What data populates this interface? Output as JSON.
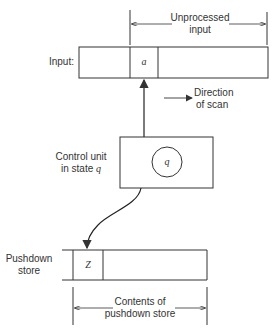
{
  "diagram": {
    "type": "pushdown-automaton-schematic",
    "input_tape": {
      "label": "Input:",
      "current_symbol": "a",
      "unprocessed_label_line1": "Unprocessed",
      "unprocessed_label_line2": "input"
    },
    "scan_direction": {
      "line1": "Direction",
      "line2": "of scan"
    },
    "control_unit": {
      "label_line1": "Control unit",
      "label_line2_prefix": "in state ",
      "state_symbol": "q",
      "circle_symbol": "q"
    },
    "pushdown_store": {
      "label_line1": "Pushdown",
      "label_line2": "store",
      "top_symbol": "Z",
      "contents_line1": "Contents of",
      "contents_line2": "pushdown store"
    }
  }
}
